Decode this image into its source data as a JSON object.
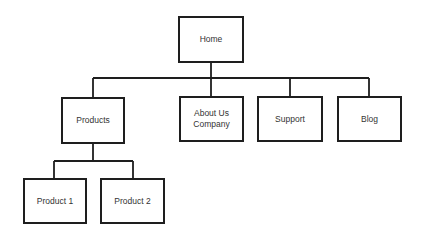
{
  "diagram": {
    "type": "sitemap-tree",
    "nodes": [
      {
        "id": "home",
        "label": "Home",
        "x": 178,
        "y": 16,
        "w": 66,
        "h": 47
      },
      {
        "id": "products",
        "label": "Products",
        "x": 61,
        "y": 97,
        "w": 64,
        "h": 47
      },
      {
        "id": "about",
        "label": "About Us\nCompany",
        "x": 179,
        "y": 96,
        "w": 65,
        "h": 46
      },
      {
        "id": "support",
        "label": "Support",
        "x": 257,
        "y": 96,
        "w": 66,
        "h": 46
      },
      {
        "id": "blog",
        "label": "Blog",
        "x": 337,
        "y": 96,
        "w": 65,
        "h": 46
      },
      {
        "id": "product1",
        "label": "Product 1",
        "x": 23,
        "y": 178,
        "w": 64,
        "h": 46
      },
      {
        "id": "product2",
        "label": "Product 2",
        "x": 100,
        "y": 178,
        "w": 65,
        "h": 46
      }
    ],
    "edges": [
      {
        "from": "home",
        "to": "products"
      },
      {
        "from": "home",
        "to": "about"
      },
      {
        "from": "home",
        "to": "support"
      },
      {
        "from": "home",
        "to": "blog"
      },
      {
        "from": "products",
        "to": "product1"
      },
      {
        "from": "products",
        "to": "product2"
      }
    ],
    "line_color": "#1e1e1e"
  }
}
